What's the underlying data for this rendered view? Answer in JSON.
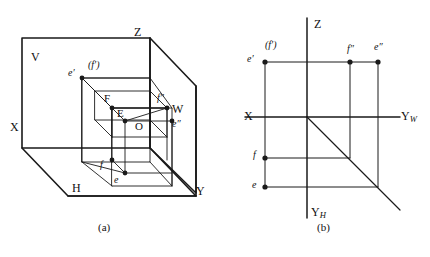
{
  "figure": {
    "type": "engineering-drawing",
    "panels": [
      {
        "id": "a",
        "caption": "(a)",
        "kind": "pictorial-3d",
        "plane_labels": [
          {
            "name": "V",
            "text": "V"
          },
          {
            "name": "H",
            "text": "H"
          },
          {
            "name": "W",
            "text": "W"
          }
        ],
        "axis_labels": [
          {
            "name": "X",
            "text": "X"
          },
          {
            "name": "Y",
            "text": "Y"
          },
          {
            "name": "Z",
            "text": "Z"
          },
          {
            "name": "O",
            "text": "O"
          }
        ],
        "point_labels": [
          {
            "name": "e-prime",
            "text": "e′"
          },
          {
            "name": "f-prime-bracketed",
            "text": "(f′)"
          },
          {
            "name": "F-space",
            "text": "F"
          },
          {
            "name": "E-space",
            "text": "E"
          },
          {
            "name": "f-double-prime",
            "text": "f″"
          },
          {
            "name": "e-double-prime",
            "text": "e″"
          },
          {
            "name": "f-lower",
            "text": "f"
          },
          {
            "name": "e-lower",
            "text": "e"
          }
        ]
      },
      {
        "id": "b",
        "caption": "(b)",
        "kind": "projection-drawing",
        "axis_labels": [
          {
            "name": "X",
            "text": "X"
          },
          {
            "name": "Z",
            "text": "Z"
          },
          {
            "name": "YW",
            "text": "Y",
            "subscript": "W"
          },
          {
            "name": "YH",
            "text": "Y",
            "subscript": "H"
          }
        ],
        "point_labels": [
          {
            "name": "e-prime",
            "text": "e′"
          },
          {
            "name": "f-prime-bracketed",
            "text": "(f′)"
          },
          {
            "name": "f-double-prime",
            "text": "f″"
          },
          {
            "name": "e-double-prime",
            "text": "e″"
          },
          {
            "name": "f-lower",
            "text": "f"
          },
          {
            "name": "e-lower",
            "text": "e"
          }
        ],
        "miter_line": "45-degree"
      }
    ],
    "colors": {
      "ink": "#1a1a1a",
      "thin": "#2b2b2b",
      "background": "#ffffff"
    }
  }
}
